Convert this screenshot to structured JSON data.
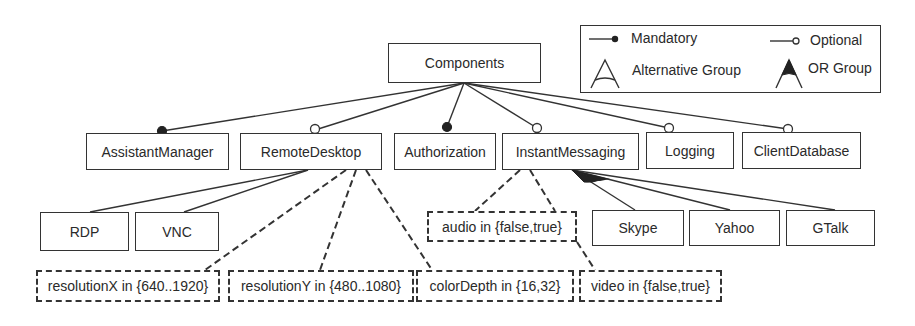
{
  "diagram": {
    "type": "feature-model",
    "root": {
      "label": "Components"
    },
    "features": [
      {
        "id": "assistantmanager",
        "label": "AssistantManager",
        "relation": "mandatory"
      },
      {
        "id": "remotedesktop",
        "label": "RemoteDesktop",
        "relation": "optional"
      },
      {
        "id": "authorization",
        "label": "Authorization",
        "relation": "mandatory"
      },
      {
        "id": "instantmessaging",
        "label": "InstantMessaging",
        "relation": "optional"
      },
      {
        "id": "logging",
        "label": "Logging",
        "relation": "optional"
      },
      {
        "id": "clientdatabase",
        "label": "ClientDatabase",
        "relation": "optional"
      }
    ],
    "remotedesktop_children": {
      "group": "alternative",
      "items": [
        {
          "id": "rdp",
          "label": "RDP"
        },
        {
          "id": "vnc",
          "label": "VNC"
        }
      ],
      "attributes": [
        {
          "id": "resolutionx",
          "label": "resolutionX in {640..1920}"
        },
        {
          "id": "resolutiony",
          "label": "resolutionY in {480..1080}"
        },
        {
          "id": "colordepth",
          "label": "colorDepth in {16,32}"
        }
      ]
    },
    "instantmessaging_children": {
      "group": "or",
      "items": [
        {
          "id": "skype",
          "label": "Skype"
        },
        {
          "id": "yahoo",
          "label": "Yahoo"
        },
        {
          "id": "gtalk",
          "label": "GTalk"
        }
      ],
      "attributes": [
        {
          "id": "audio",
          "label": "audio in {false,true}"
        },
        {
          "id": "video",
          "label": "video in {false,true}"
        }
      ]
    }
  },
  "legend": {
    "mandatory": "Mandatory",
    "optional": "Optional",
    "alternative_group": "Alternative Group",
    "or_group": "OR Group"
  },
  "colors": {
    "stroke": "#333333",
    "text": "#2a2a2a",
    "background": "#ffffff"
  }
}
